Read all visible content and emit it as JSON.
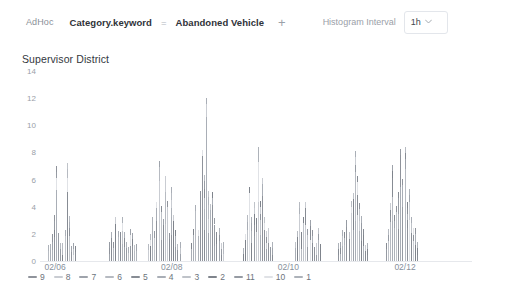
{
  "toolbar": {
    "adhoc_label": "AdHoc",
    "filter": {
      "field": "Category.keyword",
      "operator": "=",
      "value": "Abandoned Vehicle"
    },
    "add_filter_label": "+",
    "interval_label": "Histogram Interval",
    "interval_value": "1h",
    "interval_caret": "⌄"
  },
  "panel": {
    "title": "Supervisor District"
  },
  "chart_data": {
    "type": "bar",
    "title": "Supervisor District",
    "xlabel": "",
    "ylabel": "",
    "ylim": [
      0,
      14
    ],
    "yticks": [
      0,
      2,
      4,
      6,
      8,
      10,
      12,
      14
    ],
    "xticks": [
      "02/06",
      "02/08",
      "02/10",
      "02/12"
    ],
    "xtick_positions": [
      0.035,
      0.305,
      0.575,
      0.845
    ],
    "grid": false,
    "legend_position": "bottom",
    "stacked": true,
    "interval": "1h",
    "series": [
      {
        "name": "9",
        "color": "#8f939b"
      },
      {
        "name": "8",
        "color": "#c9ccd2"
      },
      {
        "name": "7",
        "color": "#9ea3ab"
      },
      {
        "name": "6",
        "color": "#b6bac1"
      },
      {
        "name": "5",
        "color": "#878c94"
      },
      {
        "name": "4",
        "color": "#a9aeb6"
      },
      {
        "name": "3",
        "color": "#bfc3c9"
      },
      {
        "name": "2",
        "color": "#7f848c"
      },
      {
        "name": "11",
        "color": "#969ba3"
      },
      {
        "name": "10",
        "color": "#e0e2e6"
      },
      {
        "name": "1",
        "color": "#adb2b9"
      }
    ],
    "clusters": [
      {
        "start": 0.018,
        "bars": [
          1,
          1,
          2,
          3,
          7,
          2,
          1,
          1,
          2,
          7,
          3,
          1,
          1,
          1
        ]
      },
      {
        "start": 0.16,
        "bars": [
          1,
          2,
          1,
          3,
          2,
          2,
          3,
          2,
          1,
          1,
          2,
          2,
          1,
          1
        ]
      },
      {
        "start": 0.25,
        "bars": [
          1,
          2,
          3,
          2,
          4,
          7,
          4,
          3,
          6,
          4,
          2,
          5,
          3,
          2,
          1,
          1
        ]
      },
      {
        "start": 0.35,
        "bars": [
          1,
          2,
          4,
          2,
          5,
          8,
          6,
          12,
          5,
          4,
          5,
          3,
          2,
          2,
          1,
          1
        ]
      },
      {
        "start": 0.47,
        "bars": [
          1,
          2,
          3,
          5,
          3,
          4,
          3,
          8,
          4,
          6,
          3,
          2,
          2,
          1,
          1
        ]
      },
      {
        "start": 0.59,
        "bars": [
          1,
          2,
          4,
          2,
          3,
          4,
          2,
          3,
          2,
          1,
          1,
          2,
          1
        ]
      },
      {
        "start": 0.69,
        "bars": [
          1,
          1,
          2,
          2,
          3,
          2,
          4,
          5,
          8,
          6,
          4,
          3,
          2,
          1,
          1
        ]
      },
      {
        "start": 0.8,
        "bars": [
          1,
          2,
          4,
          7,
          3,
          4,
          5,
          8,
          6,
          8,
          4,
          5,
          3,
          2,
          2,
          1
        ]
      }
    ]
  },
  "legend": {
    "items": [
      {
        "label": "9",
        "color": "#8f939b"
      },
      {
        "label": "8",
        "color": "#c9ccd2"
      },
      {
        "label": "7",
        "color": "#9ea3ab"
      },
      {
        "label": "6",
        "color": "#b6bac1"
      },
      {
        "label": "5",
        "color": "#878c94"
      },
      {
        "label": "4",
        "color": "#a9aeb6"
      },
      {
        "label": "3",
        "color": "#bfc3c9"
      },
      {
        "label": "2",
        "color": "#7f848c"
      },
      {
        "label": "11",
        "color": "#969ba3"
      },
      {
        "label": "10",
        "color": "#e0e2e6"
      },
      {
        "label": "1",
        "color": "#adb2b9"
      }
    ]
  }
}
